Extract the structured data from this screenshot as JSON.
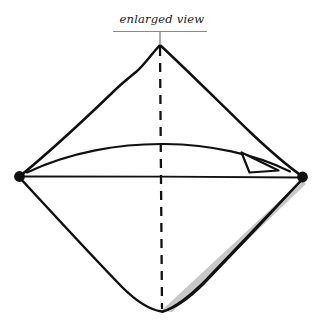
{
  "figure": {
    "kind": "hand-drawn-technical-sketch",
    "title_text": "",
    "background_color": "#ffffff",
    "ink_color": "#111111",
    "shade_color": "#c8c8c8",
    "width": 322,
    "height": 333
  },
  "callout": {
    "label": "enlarged view",
    "has_underline": true,
    "has_leader_line": true,
    "leader_target": "top-vertex"
  },
  "shape": {
    "name": "diamond-outline",
    "vertices": {
      "top": {
        "x": 160,
        "y": 45
      },
      "right": {
        "x": 303,
        "y": 177
      },
      "bottom": {
        "x": 162,
        "y": 311
      },
      "left": {
        "x": 19,
        "y": 176
      }
    },
    "stroke_width": 2.4,
    "style": "hand-drawn"
  },
  "vertex_dots": [
    {
      "name": "left-vertex-dot",
      "x": 19,
      "y": 176,
      "r": 5.2,
      "color": "#111111"
    },
    {
      "name": "right-vertex-dot",
      "x": 303,
      "y": 177,
      "r": 5.2,
      "color": "#111111"
    }
  ],
  "centerline": {
    "name": "vertical-dashed-centerline",
    "from": {
      "x": 160,
      "y": 45
    },
    "to": {
      "x": 162,
      "y": 311
    },
    "dash_pattern": "9 7",
    "stroke_width": 2.2
  },
  "horizontal_line": {
    "name": "horizontal-chord",
    "from": {
      "x": 19,
      "y": 176
    },
    "to": {
      "x": 303,
      "y": 177
    },
    "stroke_width": 1.9
  },
  "arc_arrow": {
    "name": "curved-arrow",
    "direction": "left-to-right",
    "from": {
      "x": 27,
      "y": 172
    },
    "control": {
      "x": 163,
      "y": 143
    },
    "to": {
      "x": 290,
      "y": 172
    },
    "stroke_width": 2.0,
    "arrowhead": {
      "style": "open-triangle",
      "tip": {
        "x": 277,
        "y": 170
      },
      "back_top": {
        "x": 243,
        "y": 154
      },
      "back_bottom": {
        "x": 250,
        "y": 172
      }
    }
  },
  "shaded_band": {
    "name": "gray-sliver-band",
    "edge": "lower-right",
    "fill": "#c8c8c8",
    "from_vertex": "right",
    "to_vertex": "bottom",
    "max_width_px": 14
  }
}
